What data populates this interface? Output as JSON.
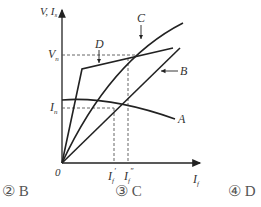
{
  "diagram": {
    "y_axis_label": "V, I",
    "y_axis_subscript": "s",
    "x_axis_label": "I",
    "x_axis_subscript": "f",
    "origin_label": "0",
    "levels": [
      {
        "name": "V",
        "subscript": "n"
      },
      {
        "name": "I",
        "subscript": "n"
      }
    ],
    "x_marks": [
      {
        "name": "I",
        "subscript": "f",
        "prime": "′"
      },
      {
        "name": "I",
        "subscript": "f",
        "prime": "″"
      }
    ],
    "curves": [
      {
        "label": "A",
        "description": "gently decreasing curve"
      },
      {
        "label": "B",
        "description": "straight line from origin"
      },
      {
        "label": "C",
        "description": "saturating curve from origin"
      },
      {
        "label": "D",
        "description": "steep rise then shallow line"
      }
    ]
  },
  "options": [
    {
      "marker": "②",
      "text": "B"
    },
    {
      "marker": "③",
      "text": "C"
    },
    {
      "marker": "④",
      "text": "D"
    }
  ]
}
